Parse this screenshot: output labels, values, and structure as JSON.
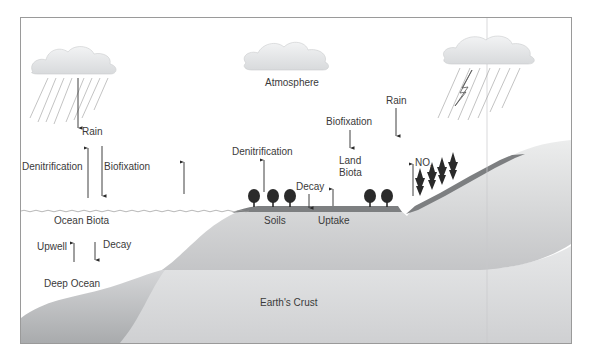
{
  "diagram": {
    "labels": {
      "atmosphere": "Atmosphere",
      "rain_left": "Rain",
      "rain_right": "Rain",
      "denitrification_ocean": "Denitrification",
      "biofixation_ocean": "Biofixation",
      "ocean_biota": "Ocean Biota",
      "upwell": "Upwell",
      "decay_ocean": "Decay",
      "deep_ocean": "Deep Ocean",
      "denitrification_land": "Denitrification",
      "biofixation_land": "Biofixation",
      "land_biota_line1": "Land",
      "land_biota_line2": "Biota",
      "decay_land": "Decay",
      "soils": "Soils",
      "uptake": "Uptake",
      "nox_main": "NO",
      "nox_sub": "x",
      "earths_crust": "Earth's Crust"
    },
    "colors": {
      "frame": "#9a9a9a",
      "cloud_fill": "#e6e8ea",
      "land_light": "#e2e3e5",
      "land_mid": "#c9cacc",
      "soil_dark": "#7d7f81",
      "crust": "#dcdddf",
      "tree": "#2a2a2a",
      "arrow": "#2a2a2a",
      "text": "#3a3a3a"
    }
  }
}
